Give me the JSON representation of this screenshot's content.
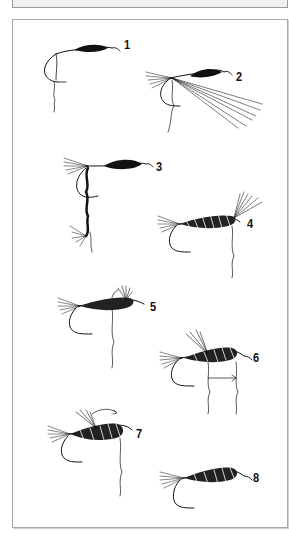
{
  "figure": {
    "steps": [
      {
        "label": "1",
        "x": 124,
        "y": 37
      },
      {
        "label": "2",
        "x": 236,
        "y": 69
      },
      {
        "label": "3",
        "x": 156,
        "y": 159
      },
      {
        "label": "4",
        "x": 247,
        "y": 216
      },
      {
        "label": "5",
        "x": 150,
        "y": 299
      },
      {
        "label": "6",
        "x": 253,
        "y": 350
      },
      {
        "label": "7",
        "x": 136,
        "y": 426
      },
      {
        "label": "8",
        "x": 253,
        "y": 470
      }
    ]
  },
  "colors": {
    "ink": "#111111",
    "panel_border": "#a8a8a8",
    "top_box_fill": "#f1f1f1"
  }
}
